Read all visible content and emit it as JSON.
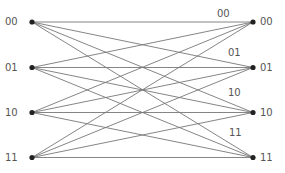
{
  "diagram": {
    "type": "trellis",
    "left_states": [
      "00",
      "01",
      "10",
      "11"
    ],
    "right_states": [
      "00",
      "01",
      "10",
      "11"
    ],
    "edge_labels": [
      "00",
      "01",
      "10",
      "11"
    ],
    "colors": {
      "line": "#777777",
      "node": "#222222",
      "text": "#555555"
    }
  }
}
